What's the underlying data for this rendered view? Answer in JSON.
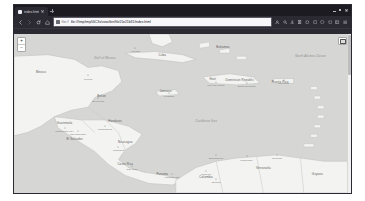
{
  "window": {
    "title": "index.html",
    "controls": {
      "minimize": "minimize",
      "maximize": "maximize",
      "close": "close"
    }
  },
  "tabs": [
    {
      "title": "index.html",
      "favicon": "page-icon",
      "active": true
    }
  ],
  "newtab_label": "+",
  "toolbar": {
    "back": "Back",
    "forward": "Forward",
    "reload": "Reload",
    "home": "Home",
    "url_scheme": "file://",
    "url_value": "file:///tmp/tmp56C3s/view/bin/file15e21b31/index.html",
    "url_placeholder": "Search with Google or enter address",
    "bookmark_star": "Bookmark this page",
    "icons": [
      "account-icon",
      "search-icon",
      "downloads-icon",
      "library-icon",
      "container-icon",
      "extension-icon",
      "shield-icon",
      "pocket-icon",
      "sidebar-icon",
      "menu-icon"
    ]
  },
  "map": {
    "zoom_in": "+",
    "zoom_out": "−",
    "layers_control": "layers-icon",
    "background_color": "#d6d6d4",
    "land_color": "#f2f2f0",
    "sea_label": "Caribbean Sea",
    "countries": [
      {
        "name": "Mexico",
        "x": 8,
        "y": 24
      },
      {
        "name": "Belize",
        "x": 26,
        "y": 39
      },
      {
        "name": "Guatemala",
        "x": 15,
        "y": 56
      },
      {
        "name": "Honduras",
        "x": 30,
        "y": 55
      },
      {
        "name": "El Salvador",
        "x": 18,
        "y": 66
      },
      {
        "name": "Nicaragua",
        "x": 33,
        "y": 68
      },
      {
        "name": "Costa Rica",
        "x": 33,
        "y": 82
      },
      {
        "name": "Panama",
        "x": 44,
        "y": 88
      },
      {
        "name": "Cuba",
        "x": 44,
        "y": 13
      },
      {
        "name": "Jamaica",
        "x": 45,
        "y": 36
      },
      {
        "name": "Haiti",
        "x": 59,
        "y": 28
      },
      {
        "name": "Dominican Republic",
        "x": 67,
        "y": 29
      },
      {
        "name": "Puerto Rico",
        "x": 79,
        "y": 30
      },
      {
        "name": "Colombia",
        "x": 57,
        "y": 90
      },
      {
        "name": "Venezuela",
        "x": 74,
        "y": 84
      },
      {
        "name": "Guyana",
        "x": 90,
        "y": 88
      },
      {
        "name": "Bahamas",
        "x": 62,
        "y": 8
      }
    ],
    "seas": [
      {
        "name": "Gulf of Mexico",
        "x": 27,
        "y": 15
      },
      {
        "name": "Caribbean Sea",
        "x": 57,
        "y": 55
      },
      {
        "name": "North Atlantic Ocean",
        "x": 88,
        "y": 14
      }
    ],
    "cities": [
      {
        "name": "Havana",
        "x": 36,
        "y": 11
      },
      {
        "name": "Merida",
        "x": 22,
        "y": 28
      },
      {
        "name": "Belmopan",
        "x": 25,
        "y": 42
      },
      {
        "name": "Guatemala City",
        "x": 15,
        "y": 61
      },
      {
        "name": "Tegucigalpa",
        "x": 27,
        "y": 60
      },
      {
        "name": "San Salvador",
        "x": 19,
        "y": 63
      },
      {
        "name": "Managua",
        "x": 31,
        "y": 73
      },
      {
        "name": "San Jose",
        "x": 35,
        "y": 85
      },
      {
        "name": "Panama City",
        "x": 47,
        "y": 90
      },
      {
        "name": "Kingston",
        "x": 46,
        "y": 39
      },
      {
        "name": "Port-au-Prince",
        "x": 60,
        "y": 32
      },
      {
        "name": "Santo Domingo",
        "x": 69,
        "y": 33
      },
      {
        "name": "San Juan",
        "x": 80,
        "y": 31
      },
      {
        "name": "Barranquilla",
        "x": 60,
        "y": 78
      },
      {
        "name": "Maracaibo",
        "x": 69,
        "y": 79
      },
      {
        "name": "Caracas",
        "x": 78,
        "y": 78
      },
      {
        "name": "Medellin",
        "x": 57,
        "y": 88
      },
      {
        "name": "Bogota",
        "x": 60,
        "y": 93
      }
    ]
  }
}
